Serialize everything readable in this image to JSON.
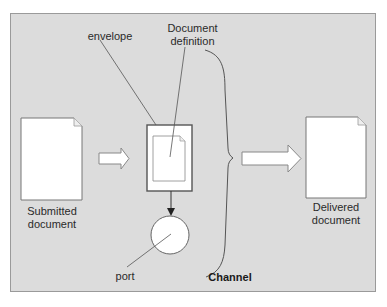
{
  "diagram": {
    "labels": {
      "envelope": "envelope",
      "document_definition_line1": "Document",
      "document_definition_line2": "definition",
      "submitted_line1": "Submitted",
      "submitted_line2": "document",
      "delivered_line1": "Delivered",
      "delivered_line2": "document",
      "port": "port",
      "channel": "Channel"
    },
    "nodes": [
      {
        "id": "submitted-document",
        "type": "document",
        "label": "Submitted document"
      },
      {
        "id": "envelope",
        "type": "envelope",
        "label": "envelope"
      },
      {
        "id": "document-definition",
        "type": "document",
        "label": "Document definition"
      },
      {
        "id": "port",
        "type": "circle",
        "label": "port"
      },
      {
        "id": "delivered-document",
        "type": "document",
        "label": "Delivered document"
      }
    ],
    "edges": [
      {
        "from": "submitted-document",
        "to": "envelope",
        "style": "block-arrow"
      },
      {
        "from": "envelope",
        "to": "port",
        "style": "arrow"
      },
      {
        "from": "channel",
        "to": "delivered-document",
        "style": "block-arrow"
      }
    ],
    "groups": [
      {
        "label": "Channel",
        "contains": [
          "envelope",
          "document-definition",
          "port"
        ],
        "style": "brace"
      }
    ],
    "colors": {
      "background": "#dcdcdc",
      "frame_border": "#9a9a9a",
      "shape_fill": "#ffffff",
      "stroke": "#555555"
    }
  }
}
